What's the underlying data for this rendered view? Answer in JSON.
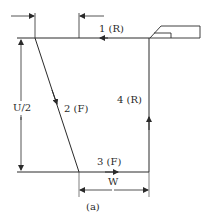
{
  "diagram": {
    "caption": "(a)",
    "segments": [
      {
        "id": 1,
        "label": "1 (R)",
        "mode": "R"
      },
      {
        "id": 2,
        "label": "2 (F)",
        "mode": "F"
      },
      {
        "id": 3,
        "label": "3 (F)",
        "mode": "F"
      },
      {
        "id": 4,
        "label": "4 (R)",
        "mode": "R"
      }
    ],
    "dimensions": {
      "vertical": "U/2",
      "horizontal": "W"
    },
    "colors": {
      "line": "#2a2a2a",
      "background": "#ffffff"
    }
  }
}
